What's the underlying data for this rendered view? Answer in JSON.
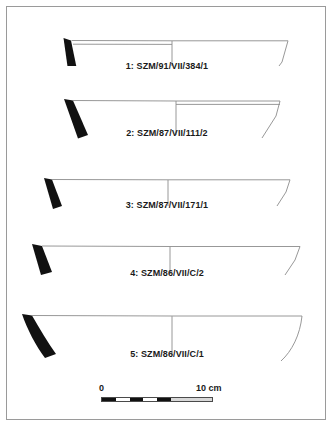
{
  "plate": {
    "title": "Archaeological pottery profile plate",
    "background_color": "#ffffff",
    "border_color": "#9a9a9a",
    "rim_fill_color": "#111111",
    "profile_line_color": "#8c8c8c",
    "axis_line_color": "#8c8c8c",
    "label_color": "#1a1a1a"
  },
  "vessels": [
    {
      "number": "1",
      "label": "1: SZM/91/VII/384/1",
      "inventory": "SZM/91/VII/384/1",
      "form": "shallow open bowl",
      "rim_side": "left",
      "rim_fill": "black",
      "profile_side": "right",
      "has_center_axis": true
    },
    {
      "number": "2",
      "label": "2: SZM/87/VII/111/2",
      "inventory": "SZM/87/VII/111/2",
      "form": "shallow open bowl",
      "rim_side": "left",
      "rim_fill": "black",
      "profile_side": "right",
      "has_center_axis": true
    },
    {
      "number": "3",
      "label": "3: SZM/87/VII/171/1",
      "inventory": "SZM/87/VII/171/1",
      "form": "wide shallow plate",
      "rim_side": "left",
      "rim_fill": "black",
      "profile_side": "right",
      "has_center_axis": true
    },
    {
      "number": "4",
      "label": "4: SZM/86/VII/C/2",
      "inventory": "SZM/86/VII/C/2",
      "form": "wide shallow plate",
      "rim_side": "left",
      "rim_fill": "black",
      "profile_side": "right",
      "has_center_axis": true
    },
    {
      "number": "5",
      "label": "5: SZM/86/VII/C/1",
      "inventory": "SZM/86/VII/C/1",
      "form": "deep open bowl",
      "rim_side": "left",
      "rim_fill": "black",
      "profile_side": "right",
      "has_center_axis": true
    }
  ],
  "scale": {
    "zero_label": "0",
    "max_label": "10 cm",
    "unit": "cm",
    "min_value": 0,
    "max_value": 10
  }
}
